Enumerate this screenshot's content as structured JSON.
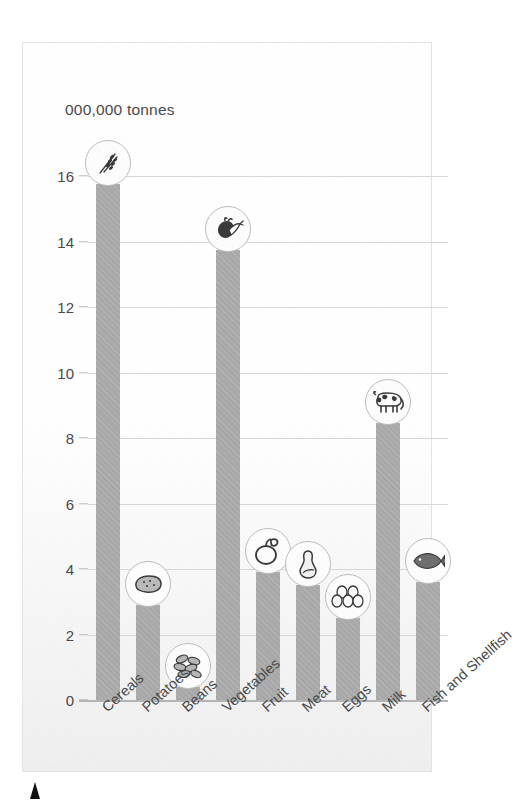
{
  "chart_data": {
    "type": "bar",
    "title": "",
    "subtitle": "",
    "unit_caption": "000,000 tonnes",
    "xlabel": "",
    "ylabel": "000,000 tonnes",
    "ylim": [
      0,
      16
    ],
    "ytick_step": 2,
    "grid": true,
    "legend": "none",
    "bar_color": "#a9a9a9",
    "gridline_color": "#d8d8d8",
    "categories": [
      "Cereals",
      "Potatoes",
      "Beans",
      "Vegetables",
      "Fruit",
      "Meat",
      "Eggs",
      "Milk",
      "Fish and Shellfish"
    ],
    "values": [
      15.75,
      2.9,
      0.4,
      13.75,
      3.9,
      3.5,
      2.5,
      8.45,
      3.6
    ],
    "ytick_labels": [
      "0",
      "2",
      "4",
      "6",
      "8",
      "10",
      "12",
      "14",
      "16"
    ],
    "ytick_values": [
      0,
      2,
      4,
      6,
      8,
      10,
      12,
      14,
      16
    ],
    "icons": [
      "wheat-icon",
      "potato-icon",
      "beans-icon",
      "root-vegetable-icon",
      "fruit-icon",
      "meat-joint-icon",
      "eggs-icon",
      "cow-icon",
      "fish-icon"
    ]
  },
  "annotations": {
    "bottom_marker": "black-triangle-marker"
  }
}
